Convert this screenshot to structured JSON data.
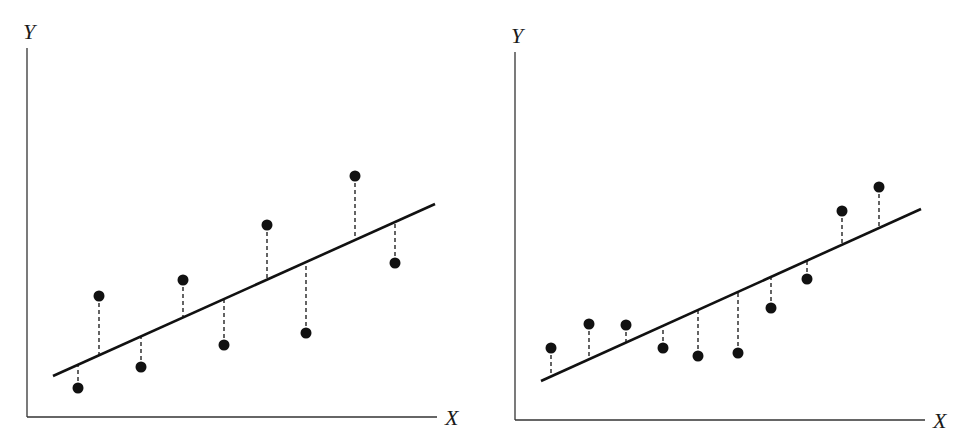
{
  "figure": {
    "colors": {
      "ink": "#111111",
      "axis": "#333333",
      "background": "#ffffff"
    }
  },
  "chart_data": [
    {
      "type": "scatter",
      "title": "",
      "xlabel": "X",
      "ylabel": "Y",
      "grid": false,
      "legend": null,
      "ticks": "none",
      "fit_line": {
        "pixel_start": [
          53,
          376
        ],
        "pixel_end": [
          435,
          204
        ]
      },
      "axes_pixels": {
        "origin": [
          27,
          417
        ],
        "y_top": [
          27,
          48
        ],
        "x_right": [
          437,
          417
        ]
      },
      "points_pixels": [
        [
          78,
          388
        ],
        [
          99,
          296
        ],
        [
          141,
          367
        ],
        [
          183,
          280
        ],
        [
          224,
          345
        ],
        [
          267,
          225
        ],
        [
          306,
          333
        ],
        [
          355,
          176
        ],
        [
          395,
          263
        ]
      ],
      "residual_signs": [
        "below",
        "above",
        "below",
        "above",
        "below",
        "above",
        "below",
        "above",
        "below"
      ],
      "note": "Residuals alternate in sign along x (pattern: random-looking, homoscedastic)"
    },
    {
      "type": "scatter",
      "title": "",
      "xlabel": "X",
      "ylabel": "Y",
      "grid": false,
      "legend": null,
      "ticks": "none",
      "fit_line": {
        "pixel_start": [
          541,
          381
        ],
        "pixel_end": [
          921,
          209
        ]
      },
      "axes_pixels": {
        "origin": [
          515,
          420
        ],
        "y_top": [
          515,
          52
        ],
        "x_right": [
          925,
          420
        ]
      },
      "points_pixels": [
        [
          551,
          348
        ],
        [
          589,
          324
        ],
        [
          626,
          325
        ],
        [
          663,
          348
        ],
        [
          698,
          356
        ],
        [
          738,
          353
        ],
        [
          771,
          308
        ],
        [
          807,
          279
        ],
        [
          842,
          211
        ],
        [
          879,
          187
        ]
      ],
      "residual_signs": [
        "above",
        "above",
        "above",
        "below",
        "below",
        "below",
        "below",
        "below",
        "above",
        "above"
      ],
      "note": "Residuals grouped: positive at ends, negative in middle (curvature pattern)"
    }
  ],
  "panels": [
    {
      "x_label": "X",
      "y_label": "Y"
    },
    {
      "x_label": "X",
      "y_label": "Y"
    }
  ]
}
